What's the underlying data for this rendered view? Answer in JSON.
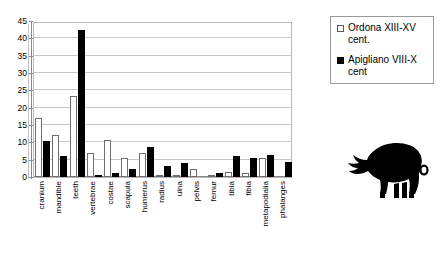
{
  "chart_data": {
    "type": "bar",
    "title": "",
    "subtitle": "",
    "xlabel": "",
    "ylabel": "",
    "ylim": [
      0,
      45
    ],
    "ytick_step": 5,
    "yticks": [
      0,
      5,
      10,
      15,
      20,
      25,
      30,
      35,
      40,
      45
    ],
    "grid": true,
    "legend_position": "right",
    "categories": [
      "cranium",
      "mandible",
      "teeth",
      "vertebrae",
      "costae",
      "scapula",
      "humerus",
      "radius",
      "ulna",
      "pelvis",
      "femur",
      "tibia",
      "fibia",
      "metapodialia",
      "phalanges"
    ],
    "series": [
      {
        "name": "Ordona XIII-XV cent.",
        "color": "#ffffff",
        "edge_color": "#6e6e6e",
        "values": [
          17,
          12.2,
          23.3,
          7,
          10.7,
          5.4,
          7,
          0.5,
          0.4,
          2.4,
          0.5,
          1.4,
          1.3,
          5.5,
          0
        ]
      },
      {
        "name": "Apigliano VIII-X cent",
        "color": "#000000",
        "edge_color": "#000000",
        "values": [
          10.4,
          6.2,
          42.4,
          0.7,
          1.1,
          2.2,
          8.7,
          3.3,
          4.1,
          0,
          1.1,
          6.2,
          5.4,
          6.3,
          4.4
        ]
      }
    ]
  },
  "legend": {
    "items": [
      {
        "swatch": "hollow-square",
        "label": "Ordona XIII-XV cent."
      },
      {
        "swatch": "solid-square",
        "label": "Apigliano VIII-X cent"
      }
    ]
  },
  "pig": {
    "icon": "pig-silhouette-icon",
    "alt": "black pig silhouette facing left"
  },
  "caption": {
    "text": ""
  }
}
